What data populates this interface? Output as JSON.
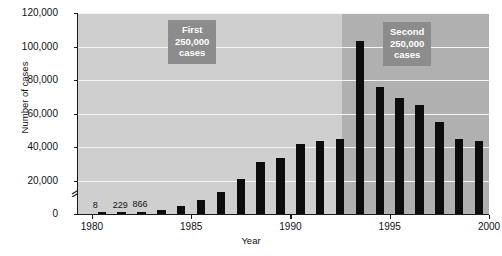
{
  "chart_data": {
    "type": "bar",
    "title": "",
    "xlabel": "Year",
    "ylabel": "Number of cases",
    "ylim": [
      0,
      120000
    ],
    "xlim": [
      1979.3,
      2000
    ],
    "grid": true,
    "legend": "none",
    "y_axis_break": true,
    "y_ticks": [
      {
        "value": 0,
        "label": "0"
      },
      {
        "value": 20000,
        "label": "20,000"
      },
      {
        "value": 40000,
        "label": "40,000"
      },
      {
        "value": 60000,
        "label": "60,000"
      },
      {
        "value": 80000,
        "label": "80,000"
      },
      {
        "value": 100000,
        "label": "100,000"
      },
      {
        "value": 120000,
        "label": "120,000"
      }
    ],
    "x_ticks": [
      {
        "value": 1980,
        "label": "1980"
      },
      {
        "value": 1985,
        "label": "1985"
      },
      {
        "value": 1990,
        "label": "1990"
      },
      {
        "value": 1995,
        "label": "1995"
      },
      {
        "value": 2000,
        "label": "2000"
      }
    ],
    "categories": [
      1980,
      1981,
      1982,
      1983,
      1984,
      1985,
      1986,
      1987,
      1988,
      1989,
      1990,
      1991,
      1992,
      1993,
      1994,
      1995,
      1996,
      1997,
      1998,
      1999
    ],
    "values": [
      8,
      229,
      866,
      2200,
      4500,
      8200,
      13100,
      21100,
      31100,
      33700,
      41600,
      43500,
      45000,
      103000,
      76000,
      69000,
      65000,
      55000,
      44500,
      43500
    ],
    "bar_labels": [
      {
        "category": 1980,
        "text": "8"
      },
      {
        "category": 1981,
        "text": "229"
      },
      {
        "category": 1982,
        "text": "866"
      }
    ],
    "annotations": [
      {
        "name": "first-250k",
        "lines": [
          "First",
          "250,000",
          "cases"
        ],
        "region_years": [
          1980,
          1992
        ]
      },
      {
        "name": "second-250k",
        "lines": [
          "Second",
          "250,000",
          "cases"
        ],
        "region_years": [
          1993,
          1999
        ]
      }
    ],
    "shaded_regions": [
      {
        "name": "first-period",
        "from": 1979.3,
        "to": 1992.6,
        "color": "#cfcfcf"
      },
      {
        "name": "second-period",
        "from": 1992.6,
        "to": 2000,
        "color": "#b0b0b0"
      }
    ],
    "colors": {
      "bar": "#0d0d0d",
      "plot_background_light": "#cfcfcf",
      "plot_background_dark": "#b0b0b0",
      "gridline": "#f4f4f4",
      "callout_background": "#8c8c8c",
      "callout_text": "#ffffff",
      "axis": "#1a1a1a"
    }
  }
}
